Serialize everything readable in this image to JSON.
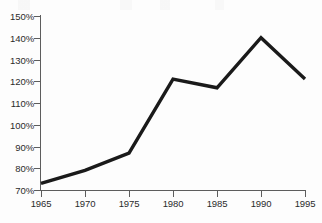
{
  "chart_data": {
    "type": "line",
    "title": "",
    "xlabel": "",
    "ylabel": "",
    "x": [
      1965,
      1970,
      1975,
      1980,
      1985,
      1990,
      1995
    ],
    "values": [
      73,
      79,
      87,
      121,
      117,
      140,
      121
    ],
    "x_tick_labels": [
      "1965",
      "1970",
      "1975",
      "1980",
      "1985",
      "1990",
      "1995"
    ],
    "y_tick_labels": [
      "150%",
      "140%",
      "130%",
      "120%",
      "110%",
      "100%",
      "90%",
      "80%",
      "70%"
    ],
    "y_tick_values": [
      150,
      140,
      130,
      120,
      110,
      100,
      90,
      80,
      70
    ],
    "ylim": [
      70,
      150
    ],
    "xlim": [
      1965,
      1995
    ],
    "grid": false,
    "legend": null,
    "series_name": "",
    "line_color": "#1a1a1a",
    "axis_color": "#5d5d5d",
    "background_color": "#fdfdfd",
    "value_suffix": "%"
  }
}
